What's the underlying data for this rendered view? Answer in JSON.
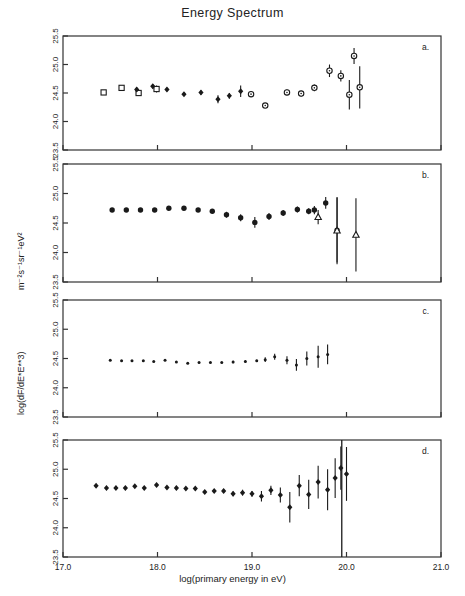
{
  "title": "Energy Spectrum",
  "axes": {
    "xlabel": "log(primary energy in eV)",
    "ylabel_main": "log(dF/dE*E**3)",
    "ylabel_units": "m⁻²s⁻¹sr⁻¹eV²",
    "xticks": [
      "17.0",
      "18.0",
      "19.0",
      "20.0",
      "21.0"
    ],
    "yticks": [
      "23.5",
      "24.0",
      "24.5",
      "25.0",
      "25.5"
    ],
    "xlim": [
      17.0,
      21.0
    ],
    "ylim": [
      23.5,
      25.5
    ]
  },
  "panel_labels": [
    "a.",
    "b.",
    "c.",
    "d."
  ],
  "colors": {
    "ink": "#1a1a1a",
    "frame": "#333333",
    "background": "#ffffff"
  },
  "chart_data": [
    {
      "type": "scatter",
      "panel": "a.",
      "title": "Energy Spectrum",
      "xlabel": "log(primary energy in eV)",
      "ylabel": "log(dF/dE*E**3)",
      "xlim": [
        17.0,
        21.0
      ],
      "ylim": [
        23.5,
        25.5
      ],
      "grid": false,
      "legend": "none",
      "series": [
        {
          "name": "panel-a-open-square",
          "marker": "open-square",
          "points": [
            {
              "x": 17.43,
              "y": 24.51,
              "yerr": 0.03
            },
            {
              "x": 17.62,
              "y": 24.59,
              "yerr": 0.03
            },
            {
              "x": 17.8,
              "y": 24.5,
              "yerr": 0.05
            },
            {
              "x": 17.99,
              "y": 24.57,
              "yerr": 0.06
            }
          ]
        },
        {
          "name": "panel-a-filled-diamond",
          "marker": "filled-diamond",
          "points": [
            {
              "x": 17.78,
              "y": 24.56,
              "yerr": 0.04
            },
            {
              "x": 17.95,
              "y": 24.62,
              "yerr": 0.04
            },
            {
              "x": 18.1,
              "y": 24.56,
              "yerr": 0.03
            },
            {
              "x": 18.28,
              "y": 24.48,
              "yerr": 0.03
            },
            {
              "x": 18.46,
              "y": 24.51,
              "yerr": 0.04
            },
            {
              "x": 18.64,
              "y": 24.39,
              "yerr": 0.07
            },
            {
              "x": 18.76,
              "y": 24.45,
              "yerr": 0.05
            },
            {
              "x": 18.88,
              "y": 24.53,
              "yerr": 0.1
            }
          ]
        },
        {
          "name": "panel-a-open-circle",
          "marker": "open-circle",
          "points": [
            {
              "x": 18.99,
              "y": 24.48,
              "yerr": 0.05
            },
            {
              "x": 19.14,
              "y": 24.28,
              "yerr": 0.04
            },
            {
              "x": 19.37,
              "y": 24.51,
              "yerr": 0.05
            },
            {
              "x": 19.52,
              "y": 24.49,
              "yerr": 0.05
            },
            {
              "x": 19.66,
              "y": 24.59,
              "yerr": 0.06
            },
            {
              "x": 19.82,
              "y": 24.89,
              "yerr": 0.11
            },
            {
              "x": 19.94,
              "y": 24.8,
              "yerr": 0.1
            },
            {
              "x": 20.03,
              "y": 24.47,
              "yerr": 0.26
            },
            {
              "x": 20.08,
              "y": 25.15,
              "yerr": 0.14
            },
            {
              "x": 20.14,
              "y": 24.6,
              "yerr": 0.37
            }
          ]
        }
      ]
    },
    {
      "type": "scatter",
      "panel": "b.",
      "xlim": [
        17.0,
        21.0
      ],
      "ylim": [
        23.5,
        25.5
      ],
      "grid": false,
      "legend": "none",
      "series": [
        {
          "name": "panel-b-filled-circle",
          "marker": "filled-circle",
          "points": [
            {
              "x": 17.52,
              "y": 24.72,
              "yerr": 0.02
            },
            {
              "x": 17.67,
              "y": 24.72,
              "yerr": 0.02
            },
            {
              "x": 17.82,
              "y": 24.72,
              "yerr": 0.02
            },
            {
              "x": 17.97,
              "y": 24.72,
              "yerr": 0.02
            },
            {
              "x": 18.12,
              "y": 24.75,
              "yerr": 0.02
            },
            {
              "x": 18.28,
              "y": 24.75,
              "yerr": 0.02
            },
            {
              "x": 18.43,
              "y": 24.72,
              "yerr": 0.02
            },
            {
              "x": 18.58,
              "y": 24.7,
              "yerr": 0.02
            },
            {
              "x": 18.73,
              "y": 24.64,
              "yerr": 0.05
            },
            {
              "x": 18.88,
              "y": 24.59,
              "yerr": 0.06
            },
            {
              "x": 19.03,
              "y": 24.51,
              "yerr": 0.09
            },
            {
              "x": 19.18,
              "y": 24.61,
              "yerr": 0.06
            },
            {
              "x": 19.33,
              "y": 24.67,
              "yerr": 0.05
            },
            {
              "x": 19.48,
              "y": 24.73,
              "yerr": 0.05
            },
            {
              "x": 19.6,
              "y": 24.7,
              "yerr": 0.05
            },
            {
              "x": 19.66,
              "y": 24.72,
              "yerr": 0.07
            },
            {
              "x": 19.78,
              "y": 24.84,
              "yerr": 0.1
            },
            {
              "x": 19.9,
              "y": 24.38,
              "yerr": 0.55
            }
          ]
        },
        {
          "name": "panel-b-triangle-limits",
          "marker": "open-triangle",
          "points": [
            {
              "x": 19.7,
              "y": 24.6,
              "yerr": 0.12
            },
            {
              "x": 19.9,
              "y": 24.37,
              "yerr": 0.57
            },
            {
              "x": 20.1,
              "y": 24.3,
              "yerr": 0.62
            }
          ]
        }
      ]
    },
    {
      "type": "scatter",
      "panel": "c.",
      "xlim": [
        17.0,
        21.0
      ],
      "ylim": [
        23.5,
        25.5
      ],
      "grid": false,
      "legend": "none",
      "series": [
        {
          "name": "panel-c-filled-circle",
          "marker": "small-filled-circle",
          "points": [
            {
              "x": 17.5,
              "y": 24.47,
              "yerr": 0.01
            },
            {
              "x": 17.62,
              "y": 24.46,
              "yerr": 0.01
            },
            {
              "x": 17.73,
              "y": 24.46,
              "yerr": 0.01
            },
            {
              "x": 17.85,
              "y": 24.46,
              "yerr": 0.01
            },
            {
              "x": 17.96,
              "y": 24.45,
              "yerr": 0.01
            },
            {
              "x": 18.08,
              "y": 24.47,
              "yerr": 0.01
            },
            {
              "x": 18.2,
              "y": 24.44,
              "yerr": 0.01
            },
            {
              "x": 18.32,
              "y": 24.42,
              "yerr": 0.01
            },
            {
              "x": 18.44,
              "y": 24.43,
              "yerr": 0.01
            },
            {
              "x": 18.56,
              "y": 24.43,
              "yerr": 0.01
            },
            {
              "x": 18.68,
              "y": 24.43,
              "yerr": 0.01
            },
            {
              "x": 18.8,
              "y": 24.44,
              "yerr": 0.02
            },
            {
              "x": 18.93,
              "y": 24.45,
              "yerr": 0.02
            },
            {
              "x": 19.05,
              "y": 24.46,
              "yerr": 0.02
            },
            {
              "x": 19.14,
              "y": 24.48,
              "yerr": 0.04
            },
            {
              "x": 19.24,
              "y": 24.53,
              "yerr": 0.05
            },
            {
              "x": 19.37,
              "y": 24.47,
              "yerr": 0.07
            },
            {
              "x": 19.47,
              "y": 24.39,
              "yerr": 0.1
            },
            {
              "x": 19.58,
              "y": 24.5,
              "yerr": 0.12
            },
            {
              "x": 19.7,
              "y": 24.53,
              "yerr": 0.19
            },
            {
              "x": 19.8,
              "y": 24.57,
              "yerr": 0.17
            }
          ]
        }
      ]
    },
    {
      "type": "scatter",
      "panel": "d.",
      "xlim": [
        17.0,
        21.0
      ],
      "ylim": [
        23.5,
        25.5
      ],
      "grid": false,
      "legend": "none",
      "vertical_marker_x": 19.95,
      "series": [
        {
          "name": "panel-d-filled-diamond",
          "marker": "filled-diamond",
          "points": [
            {
              "x": 17.35,
              "y": 24.72,
              "yerr": 0.02
            },
            {
              "x": 17.46,
              "y": 24.68,
              "yerr": 0.02
            },
            {
              "x": 17.56,
              "y": 24.68,
              "yerr": 0.02
            },
            {
              "x": 17.66,
              "y": 24.68,
              "yerr": 0.02
            },
            {
              "x": 17.76,
              "y": 24.71,
              "yerr": 0.02
            },
            {
              "x": 17.86,
              "y": 24.68,
              "yerr": 0.02
            },
            {
              "x": 17.99,
              "y": 24.73,
              "yerr": 0.02
            },
            {
              "x": 18.1,
              "y": 24.69,
              "yerr": 0.02
            },
            {
              "x": 18.2,
              "y": 24.68,
              "yerr": 0.02
            },
            {
              "x": 18.3,
              "y": 24.67,
              "yerr": 0.02
            },
            {
              "x": 18.4,
              "y": 24.67,
              "yerr": 0.02
            },
            {
              "x": 18.5,
              "y": 24.61,
              "yerr": 0.03
            },
            {
              "x": 18.6,
              "y": 24.63,
              "yerr": 0.03
            },
            {
              "x": 18.7,
              "y": 24.63,
              "yerr": 0.03
            },
            {
              "x": 18.8,
              "y": 24.58,
              "yerr": 0.04
            },
            {
              "x": 18.9,
              "y": 24.6,
              "yerr": 0.05
            },
            {
              "x": 19.0,
              "y": 24.58,
              "yerr": 0.05
            },
            {
              "x": 19.1,
              "y": 24.54,
              "yerr": 0.09
            },
            {
              "x": 19.2,
              "y": 24.64,
              "yerr": 0.08
            },
            {
              "x": 19.3,
              "y": 24.56,
              "yerr": 0.13
            },
            {
              "x": 19.4,
              "y": 24.35,
              "yerr": 0.26
            },
            {
              "x": 19.5,
              "y": 24.72,
              "yerr": 0.18
            },
            {
              "x": 19.6,
              "y": 24.57,
              "yerr": 0.25
            },
            {
              "x": 19.7,
              "y": 24.78,
              "yerr": 0.28
            },
            {
              "x": 19.8,
              "y": 24.65,
              "yerr": 0.35
            },
            {
              "x": 19.88,
              "y": 24.85,
              "yerr": 0.34
            },
            {
              "x": 19.94,
              "y": 25.02,
              "yerr": 0.37
            },
            {
              "x": 20.0,
              "y": 24.92,
              "yerr": 0.46
            }
          ]
        }
      ]
    }
  ]
}
